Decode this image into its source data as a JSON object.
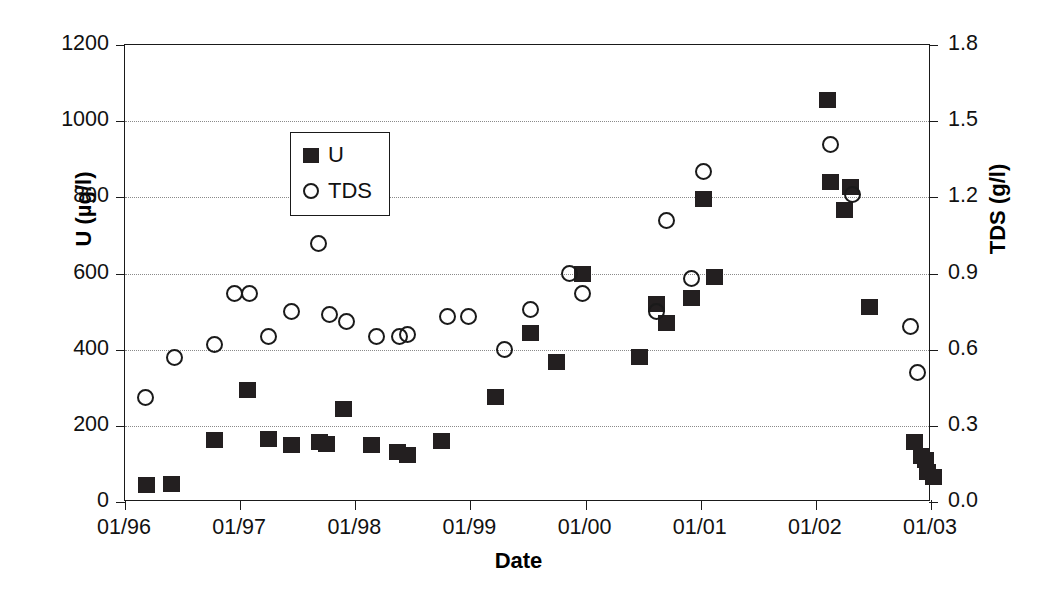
{
  "chart_data": {
    "type": "scatter",
    "title": "",
    "xlabel": "Date",
    "ylabel": "U (µg/l)",
    "y2label": "TDS (g/l)",
    "grid": true,
    "legend_position": "top-left-inside",
    "xlim": [
      "01/96",
      "01/03"
    ],
    "x_tick_labels": [
      "01/96",
      "01/97",
      "01/98",
      "01/99",
      "01/00",
      "01/01",
      "01/02",
      "01/03"
    ],
    "ylim": [
      0,
      1200
    ],
    "y_tick_labels": [
      "0",
      "200",
      "400",
      "600",
      "800",
      "1000",
      "1200"
    ],
    "y_ticks": [
      0,
      200,
      400,
      600,
      800,
      1000,
      1200
    ],
    "y2lim": [
      0.0,
      1.8
    ],
    "y2_tick_labels": [
      "0.0",
      "0.3",
      "0.6",
      "0.9",
      "1.2",
      "1.5",
      "1.8"
    ],
    "y2_ticks": [
      0.0,
      0.3,
      0.6,
      0.9,
      1.2,
      1.5,
      1.8
    ],
    "series": [
      {
        "name": "U",
        "marker": "filled-square",
        "color": "#231f20",
        "axis": "left",
        "unit": "µg/l",
        "points": [
          {
            "x": 1996.19,
            "y": 45
          },
          {
            "x": 1996.4,
            "y": 48
          },
          {
            "x": 1996.78,
            "y": 162
          },
          {
            "x": 1997.06,
            "y": 293
          },
          {
            "x": 1997.25,
            "y": 165
          },
          {
            "x": 1997.45,
            "y": 150
          },
          {
            "x": 1997.69,
            "y": 157
          },
          {
            "x": 1997.75,
            "y": 152
          },
          {
            "x": 1997.9,
            "y": 243
          },
          {
            "x": 1998.14,
            "y": 150
          },
          {
            "x": 1998.37,
            "y": 131
          },
          {
            "x": 1998.45,
            "y": 124
          },
          {
            "x": 1998.75,
            "y": 160
          },
          {
            "x": 1999.22,
            "y": 276
          },
          {
            "x": 1999.52,
            "y": 444
          },
          {
            "x": 1999.75,
            "y": 368
          },
          {
            "x": 1999.97,
            "y": 600
          },
          {
            "x": 2000.47,
            "y": 381
          },
          {
            "x": 2000.62,
            "y": 521
          },
          {
            "x": 2000.7,
            "y": 470
          },
          {
            "x": 2000.92,
            "y": 536
          },
          {
            "x": 2001.02,
            "y": 796
          },
          {
            "x": 2001.12,
            "y": 591
          },
          {
            "x": 2002.1,
            "y": 1055
          },
          {
            "x": 2002.13,
            "y": 840
          },
          {
            "x": 2002.25,
            "y": 768
          },
          {
            "x": 2002.3,
            "y": 827
          },
          {
            "x": 2002.47,
            "y": 513
          },
          {
            "x": 2002.86,
            "y": 157
          },
          {
            "x": 2002.92,
            "y": 120
          },
          {
            "x": 2002.95,
            "y": 110
          },
          {
            "x": 2002.97,
            "y": 80
          },
          {
            "x": 2003.02,
            "y": 65
          }
        ]
      },
      {
        "name": "TDS",
        "marker": "open-circle",
        "color": "#1a1a1a",
        "axis": "right",
        "unit": "g/l",
        "points": [
          {
            "x": 1996.18,
            "y": 0.41
          },
          {
            "x": 1996.43,
            "y": 0.57
          },
          {
            "x": 1996.78,
            "y": 0.62
          },
          {
            "x": 1996.95,
            "y": 0.82
          },
          {
            "x": 1997.08,
            "y": 0.82
          },
          {
            "x": 1997.25,
            "y": 0.65
          },
          {
            "x": 1997.45,
            "y": 0.75
          },
          {
            "x": 1997.68,
            "y": 1.02
          },
          {
            "x": 1997.78,
            "y": 0.74
          },
          {
            "x": 1997.92,
            "y": 0.71
          },
          {
            "x": 1998.18,
            "y": 0.65
          },
          {
            "x": 1998.38,
            "y": 0.65
          },
          {
            "x": 1998.45,
            "y": 0.66
          },
          {
            "x": 1998.8,
            "y": 0.73
          },
          {
            "x": 1998.98,
            "y": 0.73
          },
          {
            "x": 1999.3,
            "y": 0.6
          },
          {
            "x": 1999.52,
            "y": 0.76
          },
          {
            "x": 1999.86,
            "y": 0.9
          },
          {
            "x": 1999.97,
            "y": 0.82
          },
          {
            "x": 2000.62,
            "y": 0.75
          },
          {
            "x": 2000.7,
            "y": 1.11
          },
          {
            "x": 2000.92,
            "y": 0.88
          },
          {
            "x": 2001.02,
            "y": 1.3
          },
          {
            "x": 2002.13,
            "y": 1.41
          },
          {
            "x": 2002.32,
            "y": 1.21
          },
          {
            "x": 2002.82,
            "y": 0.69
          },
          {
            "x": 2002.88,
            "y": 0.51
          }
        ]
      }
    ]
  },
  "legend": {
    "items": [
      {
        "label": "U",
        "marker": "filled-square"
      },
      {
        "label": "TDS",
        "marker": "open-circle"
      }
    ]
  }
}
